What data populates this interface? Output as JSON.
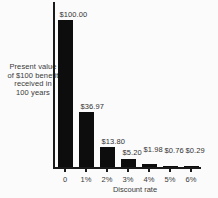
{
  "chart_data": {
    "type": "bar",
    "title": "",
    "xlabel": "Discount rate",
    "ylabel": "Present value of $100 benefit received in 100 years",
    "ylabel_lines": [
      "Present value",
      "of $100 benefit",
      "received in",
      "100 years"
    ],
    "categories": [
      "0",
      "1%",
      "2%",
      "3%",
      "4%",
      "5%",
      "6%"
    ],
    "values": [
      100.0,
      36.97,
      13.8,
      5.2,
      1.98,
      0.76,
      0.29
    ],
    "value_labels": [
      "$100.00",
      "$36.97",
      "$13.80",
      "$5.20",
      "$1.98",
      "$0.76",
      "$0.29"
    ],
    "ylim": [
      0,
      100
    ],
    "grid": "off",
    "legend": "none",
    "bar_color": "#0d0d0d",
    "axis_color": "#1a1a1a",
    "text_color": "#3a3a3a",
    "background": "#fbfbfb"
  }
}
